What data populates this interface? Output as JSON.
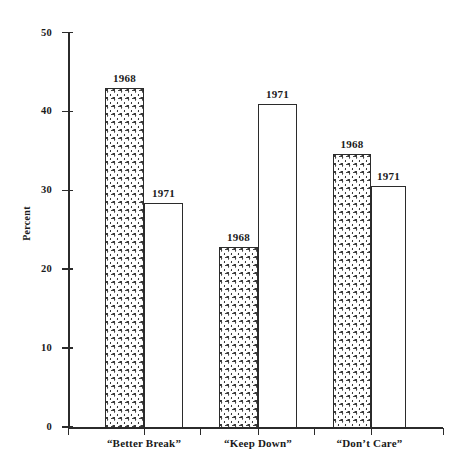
{
  "chart_data": {
    "type": "bar",
    "title": "",
    "subtitle": "",
    "xlabel": "",
    "ylabel": "Percent",
    "ylim": [
      0,
      50
    ],
    "yticks": [
      0,
      10,
      20,
      30,
      40,
      50
    ],
    "ytick_labels": [
      "0",
      "10",
      "20",
      "30",
      "40",
      "50"
    ],
    "grid": false,
    "legend": "none",
    "categories": [
      "“Better Break”",
      "“Keep Down”",
      "“Don’t Care”"
    ],
    "series": [
      {
        "name": "1968",
        "values": [
          43.0,
          22.8,
          34.6
        ]
      },
      {
        "name": "1971",
        "values": [
          28.4,
          41.0,
          30.6
        ]
      }
    ],
    "bar_annotations": [
      {
        "group": 0,
        "series": "1968",
        "text": "1968",
        "value": 43.0
      },
      {
        "group": 0,
        "series": "1971",
        "text": "1971",
        "value": 28.4
      },
      {
        "group": 1,
        "series": "1968",
        "text": "1968",
        "value": 22.8
      },
      {
        "group": 1,
        "series": "1971",
        "text": "1971",
        "value": 41.0
      },
      {
        "group": 2,
        "series": "1968",
        "text": "1968",
        "value": 34.6
      },
      {
        "group": 2,
        "series": "1971",
        "text": "1971",
        "value": 30.6
      }
    ],
    "fills": {
      "1968": "stippled",
      "1971": "white"
    },
    "colors": {
      "axis": "#2b2b2b",
      "bar_outline": "#2b2b2b",
      "stipple_dot": "#3a3a3a",
      "background": "#ffffff"
    }
  },
  "bars": [
    {
      "id": "b0",
      "label": "1968",
      "value": 43.0,
      "x": 105,
      "w": 39,
      "fill": "stipple"
    },
    {
      "id": "b1",
      "label": "1971",
      "value": 28.4,
      "x": 144,
      "w": 39,
      "fill": "plain"
    },
    {
      "id": "b2",
      "label": "1968",
      "value": 22.8,
      "x": 219,
      "w": 39,
      "fill": "stipple"
    },
    {
      "id": "b3",
      "label": "1971",
      "value": 41.0,
      "x": 258,
      "w": 39,
      "fill": "plain"
    },
    {
      "id": "b4",
      "label": "1968",
      "value": 34.6,
      "x": 333,
      "w": 38,
      "fill": "stipple"
    },
    {
      "id": "b5",
      "label": "1971",
      "value": 30.6,
      "x": 371,
      "w": 35,
      "fill": "plain"
    }
  ],
  "xticks": [
    68,
    144,
    200,
    258,
    314,
    371,
    443
  ]
}
